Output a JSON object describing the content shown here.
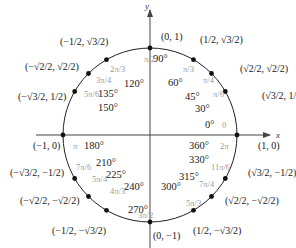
{
  "chart_data": {
    "type": "diagram",
    "axes": {
      "x_label": "x",
      "y_label": "y"
    },
    "colors": {
      "ink": "#1a1a1a",
      "radian_label": "#9a9a9a",
      "axis": "#444444"
    },
    "points": [
      {
        "deg": 0,
        "degree_label": "0°",
        "degree_label_alt": "360°",
        "radian_label": "0",
        "radian_label_alt": "2π",
        "coord_x": "1",
        "coord_y": "0",
        "coord_label": "(1, 0)"
      },
      {
        "deg": 30,
        "degree_label": "30°",
        "radian_label": "π/6",
        "coord_label": "(√3/2, 1/2)"
      },
      {
        "deg": 45,
        "degree_label": "45°",
        "radian_label": "π/4",
        "coord_label": "(√2/2, √2/2)"
      },
      {
        "deg": 60,
        "degree_label": "60°",
        "radian_label": "π/3",
        "coord_label": "(1/2, √3/2)"
      },
      {
        "deg": 90,
        "degree_label": "90°",
        "radian_label": "π/2",
        "coord_label": "(0, 1)"
      },
      {
        "deg": 120,
        "degree_label": "120°",
        "radian_label": "2π/3",
        "coord_label": "(−1/2, √3/2)"
      },
      {
        "deg": 135,
        "degree_label": "135°",
        "radian_label": "3π/4",
        "coord_label": "(−√2/2, √2/2)"
      },
      {
        "deg": 150,
        "degree_label": "150°",
        "radian_label": "5π/6",
        "coord_label": "(−√3/2, 1/2)"
      },
      {
        "deg": 180,
        "degree_label": "180°",
        "radian_label": "π",
        "coord_label": "(−1, 0)"
      },
      {
        "deg": 210,
        "degree_label": "210°",
        "radian_label": "7π/6",
        "coord_label": "(−√3/2, −1/2)"
      },
      {
        "deg": 225,
        "degree_label": "225°",
        "radian_label": "5π/4",
        "coord_label": "(−√2/2, −√2/2)"
      },
      {
        "deg": 240,
        "degree_label": "240°",
        "radian_label": "4π/3",
        "coord_label": "(−1/2, −√3/2)"
      },
      {
        "deg": 270,
        "degree_label": "270°",
        "radian_label": "3π/2",
        "coord_label": "(0, −1)"
      },
      {
        "deg": 300,
        "degree_label": "300°",
        "radian_label": "5π/3",
        "coord_label": "(1/2, −√3/2)"
      },
      {
        "deg": 315,
        "degree_label": "315°",
        "radian_label": "7π/4",
        "coord_label": "(√2/2, −√2/2)"
      },
      {
        "deg": 330,
        "degree_label": "330°",
        "radian_label": "11π/6",
        "coord_label": "(√3/2, −1/2)"
      }
    ]
  }
}
